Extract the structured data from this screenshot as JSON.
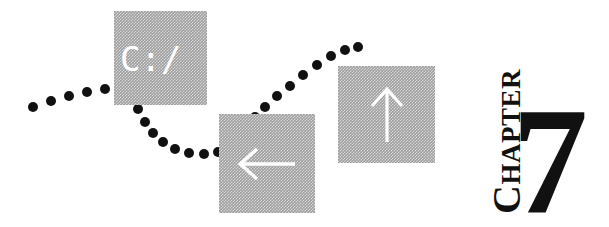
{
  "page": {
    "width": 609,
    "height": 227,
    "background_color": "#ffffff",
    "ink_color": "#111111",
    "tile_gray": "#9e9e9e",
    "tile_pattern": "halftone-dither-50"
  },
  "heading": {
    "chapter_label_first": "C",
    "chapter_label_rest": "HAPTER",
    "chapter_label_full": "CHAPTER",
    "chapter_number": "7",
    "orientation": "rotated-90-ccw"
  },
  "tiles": [
    {
      "id": "prompt-tile",
      "content_kind": "text",
      "text": "C:/",
      "text_color": "#ffffff",
      "x": 114,
      "y": 11,
      "w": 93,
      "h": 94,
      "font_size": 34
    },
    {
      "id": "left-arrow-tile",
      "content_kind": "icon",
      "icon": "arrow-left-icon",
      "icon_color": "#ffffff",
      "x": 219,
      "y": 114,
      "w": 96,
      "h": 99
    },
    {
      "id": "up-arrow-tile",
      "content_kind": "icon",
      "icon": "arrow-up-icon",
      "icon_color": "#ffffff",
      "x": 338,
      "y": 66,
      "w": 97,
      "h": 97
    }
  ],
  "dot_trail": {
    "color": "#111111",
    "count": 27,
    "diameter": 10,
    "points": [
      [
        33,
        107
      ],
      [
        51,
        101
      ],
      [
        69,
        96
      ],
      [
        87,
        92
      ],
      [
        105,
        89
      ],
      [
        121,
        89
      ],
      [
        131,
        97
      ],
      [
        138,
        109
      ],
      [
        145,
        122
      ],
      [
        153,
        133
      ],
      [
        163,
        142
      ],
      [
        175,
        149
      ],
      [
        189,
        153
      ],
      [
        204,
        154
      ],
      [
        218,
        152
      ],
      [
        229,
        146
      ],
      [
        238,
        137
      ],
      [
        246,
        127
      ],
      [
        255,
        117
      ],
      [
        265,
        107
      ],
      [
        277,
        96
      ],
      [
        290,
        86
      ],
      [
        303,
        75
      ],
      [
        317,
        65
      ],
      [
        331,
        56
      ],
      [
        345,
        50
      ],
      [
        358,
        47
      ]
    ]
  }
}
